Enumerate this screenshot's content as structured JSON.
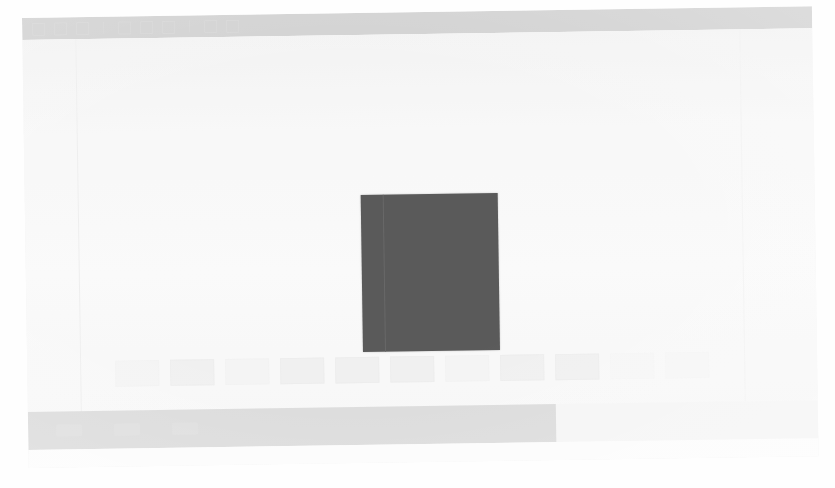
{
  "window": {
    "title": "",
    "background_color": "#f2f2f2",
    "toolbar_color": "#b9b9b9",
    "statusbar_color": "#c9c9c9",
    "stage_color": "#050505"
  },
  "toolbar": {
    "items": [
      {
        "name": "open-icon",
        "label": ""
      },
      {
        "name": "save-icon",
        "label": ""
      },
      {
        "name": "print-icon",
        "label": ""
      },
      {
        "name": "zoom-out-icon",
        "label": ""
      },
      {
        "name": "zoom-in-icon",
        "label": ""
      },
      {
        "name": "fit-page-icon",
        "label": ""
      },
      {
        "name": "rotate-icon",
        "label": ""
      },
      {
        "name": "settings-icon",
        "label": ""
      }
    ]
  },
  "stage": {
    "name": "document-stage",
    "caption": "",
    "width_px": 137,
    "height_px": 157
  },
  "filmstrip": {
    "name": "thumbnail-strip",
    "thumbnails": [
      {
        "label": "",
        "tone": "dim"
      },
      {
        "label": "",
        "tone": "normal"
      },
      {
        "label": "",
        "tone": "dim"
      },
      {
        "label": "",
        "tone": "normal"
      },
      {
        "label": "",
        "tone": "normal"
      },
      {
        "label": "",
        "tone": "normal"
      },
      {
        "label": "",
        "tone": "dim"
      },
      {
        "label": "",
        "tone": "normal"
      },
      {
        "label": "",
        "tone": "normal"
      },
      {
        "label": "",
        "tone": "dimmer"
      },
      {
        "label": "",
        "tone": "dimmer"
      }
    ]
  },
  "statusbar": {
    "left_text": "",
    "center_text": "",
    "right_text": "",
    "chips": [
      "",
      "",
      ""
    ]
  }
}
